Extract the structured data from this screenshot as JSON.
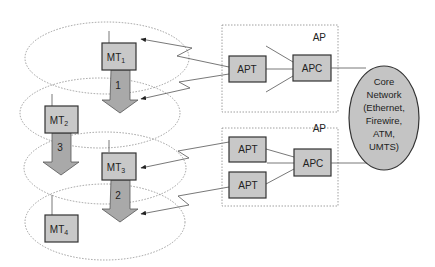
{
  "diagram": {
    "mobile_terminals": [
      {
        "id": "mt1",
        "label": "MT",
        "sub": "1"
      },
      {
        "id": "mt2",
        "label": "MT",
        "sub": "2"
      },
      {
        "id": "mt3",
        "label": "MT",
        "sub": "3"
      },
      {
        "id": "mt4",
        "label": "MT",
        "sub": "4"
      }
    ],
    "movements": [
      {
        "id": "move1",
        "label": "1"
      },
      {
        "id": "move2",
        "label": "2"
      },
      {
        "id": "move3",
        "label": "3"
      }
    ],
    "access_points": [
      {
        "id": "ap1",
        "label": "AP",
        "apts": [
          "APT"
        ],
        "apc": "APC"
      },
      {
        "id": "ap2",
        "label": "AP",
        "apts": [
          "APT",
          "APT"
        ],
        "apc": "APC"
      }
    ],
    "core_network": {
      "lines": [
        "Core",
        "Network",
        "(Ethernet,",
        "Firewire,",
        "ATM,",
        "UMTS)"
      ]
    },
    "colors": {
      "box_fill": "#c8c8c8",
      "arrow_fill": "#a9a9a9",
      "core_fill": "#c4c4c4"
    }
  }
}
